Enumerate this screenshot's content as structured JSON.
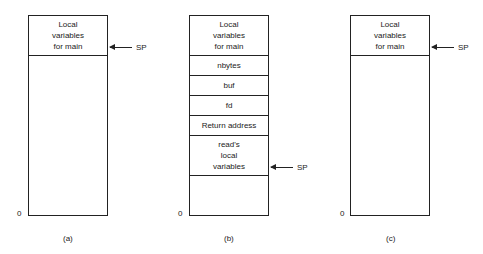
{
  "figures": [
    {
      "caption": "(a)",
      "zero_label": "0",
      "cells": [
        "Local\nvariables\nfor main"
      ],
      "sp_label": "SP"
    },
    {
      "caption": "(b)",
      "zero_label": "0",
      "cells": [
        "Local\nvariables\nfor main",
        "nbytes",
        "buf",
        "fd",
        "Return address",
        "read's\nlocal\nvariables"
      ],
      "sp_label": "SP"
    },
    {
      "caption": "(c)",
      "zero_label": "0",
      "cells": [
        "Local\nvariables\nfor main"
      ],
      "sp_label": "SP"
    }
  ]
}
